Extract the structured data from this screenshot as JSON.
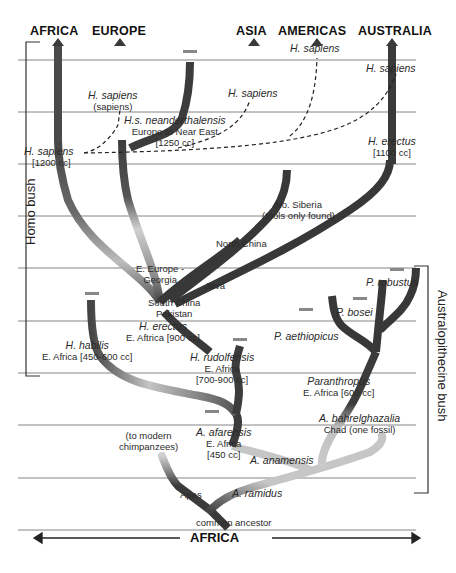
{
  "regions": {
    "africa": "AFRICA",
    "europe": "EUROPE",
    "asia": "ASIA",
    "americas": "AMERICAS",
    "australia": "AUSTRALIA"
  },
  "brackets": {
    "homo": "Homo bush",
    "australopithecine": "Australopithecine bush"
  },
  "bottom_axis": {
    "label": "AFRICA"
  },
  "colors": {
    "branch_dark": "#3a3a3a",
    "branch_light": "#c8c8c8",
    "gridline": "#777777"
  },
  "labels": {
    "sapiens_americas": {
      "name": "H. sapiens"
    },
    "sapiens_australia": {
      "name": "H. sapiens"
    },
    "sapiens_europe": {
      "name": "H. sapiens",
      "detail": "(sapiens)"
    },
    "sapiens_asia": {
      "name": "H. sapiens"
    },
    "neanderthal": {
      "name": "H.s. neanderthalensis",
      "detail": "Europe to Near East",
      "cc": "[1250 cc]"
    },
    "sapiens_africa": {
      "name": "H. sapiens",
      "cc": "[1200 cc]"
    },
    "erectus_australia": {
      "name": "H. erectus",
      "cc": "[1100 cc]"
    },
    "siberia": {
      "line1": "No. Siberia",
      "line2": "(tools only found)"
    },
    "north_china": {
      "name": "North China"
    },
    "georgia": {
      "line1": "E. Europe -",
      "line2": "Georgia"
    },
    "java": {
      "name": "Java"
    },
    "south_china": {
      "line1": "South China",
      "line2": "Pakistan"
    },
    "erectus_africa": {
      "name": "H. erectus",
      "detail": "E. Aftrica [900 cc]"
    },
    "habilis": {
      "name": "H. habilis",
      "detail": "E. Africa [450-600 cc]"
    },
    "rudolfensis": {
      "name": "H. rudolfensis",
      "detail": "E. Africa",
      "cc": "[700-900 cc]"
    },
    "robustus": {
      "name": "P. robustus"
    },
    "bosei": {
      "name": "P. bosei"
    },
    "aethiopicus": {
      "name": "P. aethiopicus"
    },
    "paranthropus": {
      "name": "Paranthropus",
      "detail": "E. Africa [600 cc]"
    },
    "bahrelghazalia": {
      "name": "A. bahrelghazalia",
      "detail": "Chad (one fossil)"
    },
    "afarensis": {
      "name": "A. afarensis",
      "detail": "E. Africa",
      "cc": "[450 cc]"
    },
    "chimps": {
      "line1": "(to modern",
      "line2": "chimpanzees)"
    },
    "anamensis": {
      "name": "A. anamensis"
    },
    "apes": {
      "name": "Apes"
    },
    "ramidus": {
      "name": "A. ramidus"
    },
    "common_ancestor": {
      "name": "common ancestor"
    }
  }
}
